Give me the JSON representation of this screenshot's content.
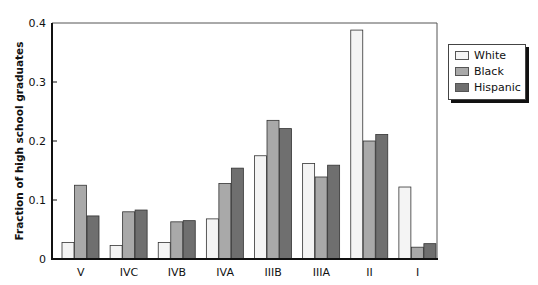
{
  "chart_data": {
    "type": "bar",
    "title": "",
    "xlabel": "",
    "ylabel": "Fraction of high school graduates",
    "ylim": [
      0,
      0.4
    ],
    "yticks": [
      "0",
      "0.1",
      "0.2",
      "0.3",
      "0.4"
    ],
    "grid": false,
    "legend_position": "right",
    "categories": [
      "V",
      "IVC",
      "IVB",
      "IVA",
      "IIIB",
      "IIIA",
      "II",
      "I"
    ],
    "series": [
      {
        "name": "White",
        "color": "#f4f4f4",
        "values": [
          0.028,
          0.023,
          0.028,
          0.068,
          0.175,
          0.162,
          0.388,
          0.122
        ]
      },
      {
        "name": "Black",
        "color": "#a9a9a9",
        "values": [
          0.125,
          0.08,
          0.063,
          0.128,
          0.235,
          0.139,
          0.2,
          0.02
        ]
      },
      {
        "name": "Hispanic",
        "color": "#6f6f6f",
        "values": [
          0.073,
          0.083,
          0.065,
          0.154,
          0.221,
          0.159,
          0.211,
          0.026
        ]
      }
    ]
  },
  "legend": {
    "items": [
      {
        "label": "White"
      },
      {
        "label": "Black"
      },
      {
        "label": "Hispanic"
      }
    ]
  }
}
